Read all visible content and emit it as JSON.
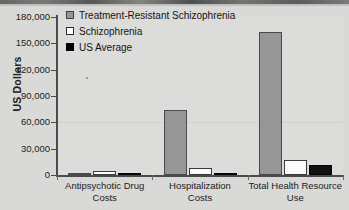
{
  "chart_data": {
    "type": "bar",
    "title": "",
    "xlabel": "",
    "ylabel": "US Dollars",
    "ylim": [
      0,
      180000
    ],
    "grid": false,
    "legend_position": "top-left",
    "categories": [
      "Antipsychotic Drug Costs",
      "Hospitalization Costs",
      "Total Health Resource Use"
    ],
    "category_lines": [
      [
        "Antipsychotic Drug",
        "Costs"
      ],
      [
        "Hospitalization",
        "Costs"
      ],
      [
        "Total Health Resource",
        "Use"
      ]
    ],
    "ytick_labels": [
      "0",
      "30,000",
      "60,000",
      "90,000",
      "120,000",
      "150,000",
      "180,000"
    ],
    "ytick_values": [
      0,
      30000,
      60000,
      90000,
      120000,
      150000,
      180000
    ],
    "series": [
      {
        "name": "Treatment-Resistant Schizophrenia",
        "color": "#969696",
        "values": [
          1200,
          73500,
          163000
        ]
      },
      {
        "name": "Schizophrenia",
        "color": "#ffffff",
        "values": [
          4200,
          8000,
          17500
        ]
      },
      {
        "name": "US Average",
        "color": "#000000",
        "values": [
          1400,
          2000,
          11500
        ]
      }
    ]
  },
  "legend": {
    "items": [
      {
        "label": "Treatment-Resistant Schizophrenia",
        "swatch": "trs"
      },
      {
        "label": "Schizophrenia",
        "swatch": "schiz"
      },
      {
        "label": "US Average",
        "swatch": "usavg"
      }
    ]
  },
  "axis": {
    "y_title": "US Dollars"
  }
}
